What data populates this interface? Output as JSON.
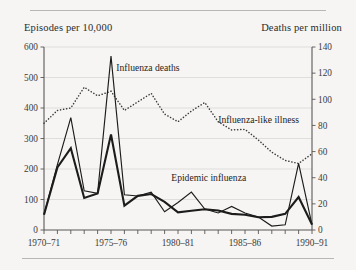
{
  "figure": {
    "axis_label_left": "Episodes per 10,000",
    "axis_label_right": "Deaths per million"
  },
  "chart_data": {
    "type": "line",
    "title": "",
    "xlabel": "",
    "ylabel": "Episodes per 10,000",
    "y2label": "Deaths per million",
    "ylim": [
      0,
      600
    ],
    "y2lim": [
      0,
      140
    ],
    "yticks": [
      0,
      100,
      200,
      300,
      400,
      500,
      600
    ],
    "y2ticks": [
      0,
      20,
      40,
      60,
      80,
      100,
      120,
      140
    ],
    "grid": true,
    "legend": "inline-annotations",
    "x": [
      "1970-71",
      "1971-72",
      "1972-73",
      "1973-74",
      "1974-75",
      "1975-76",
      "1976-77",
      "1977-78",
      "1978-79",
      "1979-80",
      "1980-81",
      "1981-82",
      "1982-83",
      "1983-84",
      "1984-85",
      "1985-86",
      "1986-87",
      "1987-88",
      "1988-89",
      "1989-90",
      "1990-91"
    ],
    "xtick_labels": [
      "1970–71",
      "1975–76",
      "1980–81",
      "1985–86",
      "1990–91"
    ],
    "xtick_indices": [
      0,
      5,
      10,
      15,
      20
    ],
    "series": [
      {
        "name": "Influenza deaths",
        "style": "thin-solid",
        "axis": "right",
        "unit": "Deaths per million",
        "values": [
          12,
          50,
          86,
          30,
          28,
          133,
          27,
          26,
          29,
          14,
          21,
          29,
          16,
          13,
          18,
          13,
          10,
          3,
          4,
          51,
          4
        ]
      },
      {
        "name": "Epidemic influenza",
        "style": "thick-solid",
        "axis": "left",
        "unit": "Episodes per 10,000",
        "values": [
          50,
          205,
          268,
          105,
          120,
          313,
          80,
          112,
          118,
          92,
          58,
          63,
          68,
          64,
          53,
          50,
          42,
          43,
          53,
          108,
          18
        ]
      },
      {
        "name": "Influenza-like illness",
        "style": "dotted",
        "axis": "left",
        "unit": "Episodes per 10,000",
        "values": [
          350,
          392,
          400,
          468,
          440,
          455,
          392,
          420,
          448,
          380,
          355,
          390,
          418,
          355,
          328,
          330,
          295,
          255,
          228,
          218,
          250
        ]
      }
    ],
    "annotations": [
      {
        "text": "Influenza deaths",
        "x_index": 5.4,
        "y_value": 522
      },
      {
        "text": "Influenza-like illness",
        "x_index": 13.0,
        "y_value": 350
      },
      {
        "text": "Epidemic influenza",
        "x_index": 9.5,
        "y_value": 160
      }
    ]
  }
}
